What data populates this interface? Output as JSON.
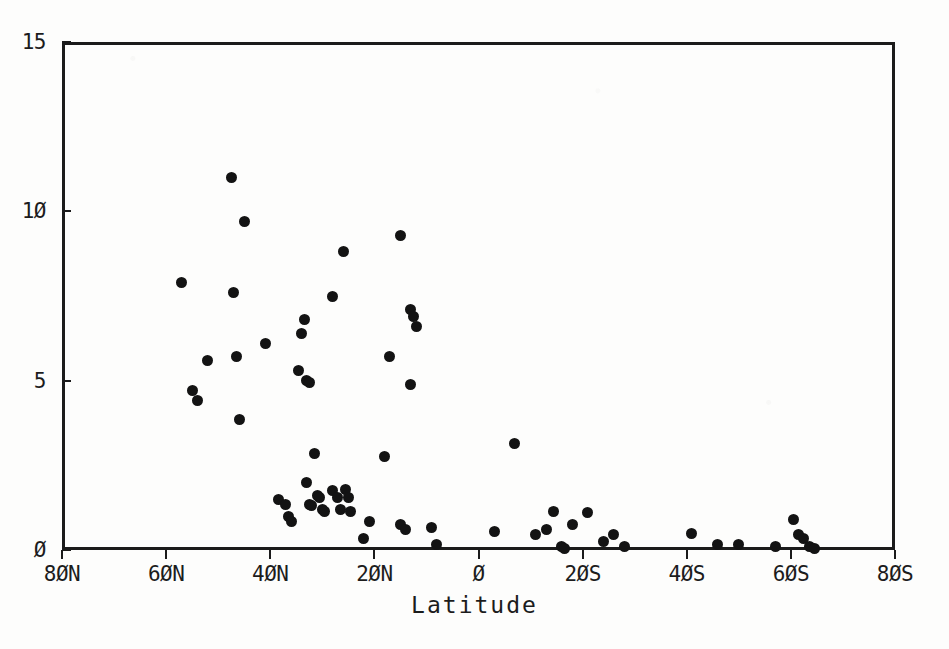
{
  "chart_data": {
    "type": "scatter",
    "title": "",
    "xlabel": "Latitude",
    "ylabel": "",
    "grid": false,
    "legend": "none",
    "xlim": [
      80,
      -80
    ],
    "ylim": [
      0,
      15
    ],
    "x_axis_direction": "north-to-south",
    "xticks": [
      {
        "value": 80,
        "label": "8ØN"
      },
      {
        "value": 60,
        "label": "6ØN"
      },
      {
        "value": 40,
        "label": "4ØN"
      },
      {
        "value": 20,
        "label": "2ØN"
      },
      {
        "value": 0,
        "label": "Ø"
      },
      {
        "value": -20,
        "label": "2ØS"
      },
      {
        "value": -40,
        "label": "4ØS"
      },
      {
        "value": -60,
        "label": "6ØS"
      },
      {
        "value": -80,
        "label": "8ØS"
      }
    ],
    "yticks": [
      {
        "value": 0,
        "label": "Ø"
      },
      {
        "value": 5,
        "label": "5"
      },
      {
        "value": 10,
        "label": "1Ø"
      },
      {
        "value": 15,
        "label": "15"
      }
    ],
    "marker": "filled-circle",
    "marker_color": "#131313",
    "points": [
      {
        "x": 57.0,
        "y": 7.9
      },
      {
        "x": 55.0,
        "y": 4.7
      },
      {
        "x": 54.0,
        "y": 4.4
      },
      {
        "x": 52.0,
        "y": 5.6
      },
      {
        "x": 47.5,
        "y": 11.0
      },
      {
        "x": 47.0,
        "y": 7.6
      },
      {
        "x": 46.5,
        "y": 5.7
      },
      {
        "x": 45.0,
        "y": 9.7
      },
      {
        "x": 46.0,
        "y": 3.85
      },
      {
        "x": 41.0,
        "y": 6.1
      },
      {
        "x": 38.5,
        "y": 1.5
      },
      {
        "x": 37.0,
        "y": 1.35
      },
      {
        "x": 36.5,
        "y": 1.0
      },
      {
        "x": 36.0,
        "y": 0.85
      },
      {
        "x": 34.5,
        "y": 5.3
      },
      {
        "x": 34.0,
        "y": 6.4
      },
      {
        "x": 33.5,
        "y": 6.8
      },
      {
        "x": 33.0,
        "y": 5.0
      },
      {
        "x": 32.5,
        "y": 4.95
      },
      {
        "x": 33.0,
        "y": 2.0
      },
      {
        "x": 32.5,
        "y": 1.35
      },
      {
        "x": 32.0,
        "y": 1.3
      },
      {
        "x": 31.5,
        "y": 2.85
      },
      {
        "x": 31.0,
        "y": 1.6
      },
      {
        "x": 30.5,
        "y": 1.55
      },
      {
        "x": 30.0,
        "y": 1.2
      },
      {
        "x": 29.5,
        "y": 1.15
      },
      {
        "x": 28.0,
        "y": 7.5
      },
      {
        "x": 26.0,
        "y": 8.8
      },
      {
        "x": 28.0,
        "y": 1.75
      },
      {
        "x": 27.0,
        "y": 1.55
      },
      {
        "x": 26.5,
        "y": 1.2
      },
      {
        "x": 25.5,
        "y": 1.8
      },
      {
        "x": 25.0,
        "y": 1.55
      },
      {
        "x": 24.5,
        "y": 1.15
      },
      {
        "x": 22.0,
        "y": 0.35
      },
      {
        "x": 21.0,
        "y": 0.85
      },
      {
        "x": 18.0,
        "y": 2.75
      },
      {
        "x": 17.0,
        "y": 5.7
      },
      {
        "x": 15.0,
        "y": 9.3
      },
      {
        "x": 13.0,
        "y": 7.1
      },
      {
        "x": 12.5,
        "y": 6.9
      },
      {
        "x": 12.0,
        "y": 6.6
      },
      {
        "x": 13.0,
        "y": 4.9
      },
      {
        "x": 15.0,
        "y": 0.75
      },
      {
        "x": 14.0,
        "y": 0.6
      },
      {
        "x": 9.0,
        "y": 0.65
      },
      {
        "x": 8.0,
        "y": 0.15
      },
      {
        "x": -7.0,
        "y": 3.15
      },
      {
        "x": -3.0,
        "y": 0.55
      },
      {
        "x": -11.0,
        "y": 0.45
      },
      {
        "x": -13.0,
        "y": 0.6
      },
      {
        "x": -14.5,
        "y": 1.15
      },
      {
        "x": -16.0,
        "y": 0.1
      },
      {
        "x": -16.5,
        "y": 0.05
      },
      {
        "x": -18.0,
        "y": 0.75
      },
      {
        "x": -21.0,
        "y": 1.1
      },
      {
        "x": -24.0,
        "y": 0.25
      },
      {
        "x": -26.0,
        "y": 0.45
      },
      {
        "x": -28.0,
        "y": 0.1
      },
      {
        "x": -41.0,
        "y": 0.5
      },
      {
        "x": -46.0,
        "y": 0.15
      },
      {
        "x": -50.0,
        "y": 0.15
      },
      {
        "x": -57.0,
        "y": 0.1
      },
      {
        "x": -60.5,
        "y": 0.9
      },
      {
        "x": -61.5,
        "y": 0.45
      },
      {
        "x": -62.5,
        "y": 0.35
      },
      {
        "x": -63.5,
        "y": 0.1
      },
      {
        "x": -64.5,
        "y": 0.05
      }
    ]
  }
}
